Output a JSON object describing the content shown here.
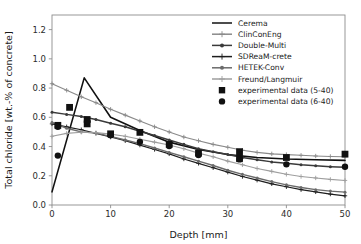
{
  "chart_data": {
    "type": "line",
    "title": "",
    "xlabel": "Depth [mm]",
    "ylabel": "Total chloride [wt.-% of concrete]",
    "xlim": [
      0,
      50
    ],
    "ylim": [
      0.0,
      1.3
    ],
    "xticks": [
      "0",
      "10",
      "20",
      "30",
      "40",
      "50"
    ],
    "xtick_values": [
      0,
      10,
      20,
      30,
      40,
      50
    ],
    "yticks": [
      "0.0",
      "0.2",
      "0.4",
      "0.6",
      "0.8",
      "1.0",
      "1.2"
    ],
    "ytick_values": [
      0.0,
      0.2,
      0.4,
      0.6,
      0.8,
      1.0,
      1.2
    ],
    "grid": false,
    "legend_position": "upper right",
    "series": [
      {
        "name": "Cerema",
        "color": "#111111",
        "marker": "none",
        "linewidth": 1.6,
        "x": [
          0,
          5.5,
          10,
          15,
          20,
          25,
          30,
          35,
          40,
          45,
          50
        ],
        "y": [
          0.09,
          0.87,
          0.6,
          0.51,
          0.43,
          0.38,
          0.345,
          0.325,
          0.315,
          0.31,
          0.305
        ]
      },
      {
        "name": "ClinConEng",
        "color": "#8a8a8a",
        "marker": "plus",
        "linewidth": 1.1,
        "x": [
          0,
          2.5,
          5,
          7.5,
          10,
          12.5,
          15,
          17.5,
          20,
          22.5,
          25,
          27.5,
          30,
          32.5,
          35,
          37.5,
          40,
          42.5,
          45,
          47.5,
          50
        ],
        "y": [
          0.83,
          0.785,
          0.74,
          0.7,
          0.655,
          0.615,
          0.575,
          0.535,
          0.5,
          0.465,
          0.44,
          0.415,
          0.395,
          0.375,
          0.36,
          0.35,
          0.345,
          0.34,
          0.335,
          0.332,
          0.33
        ]
      },
      {
        "name": "Double-Multi",
        "color": "#3a3a3a",
        "marker": "circle",
        "linewidth": 1.5,
        "x": [
          0,
          2.5,
          5,
          7.5,
          10,
          12.5,
          15,
          17.5,
          20,
          22.5,
          25,
          27.5,
          30,
          32.5,
          35,
          37.5,
          40,
          42.5,
          45,
          47.5,
          50
        ],
        "y": [
          0.635,
          0.62,
          0.605,
          0.585,
          0.56,
          0.535,
          0.505,
          0.475,
          0.445,
          0.415,
          0.385,
          0.365,
          0.345,
          0.325,
          0.31,
          0.295,
          0.285,
          0.275,
          0.268,
          0.262,
          0.258
        ]
      },
      {
        "name": "SDReaM-crete",
        "color": "#1d1d1d",
        "marker": "plus",
        "linewidth": 1.2,
        "x": [
          0,
          2.5,
          5,
          7.5,
          10,
          12.5,
          15,
          17.5,
          20,
          22.5,
          25,
          27.5,
          30,
          32.5,
          35,
          37.5,
          40,
          42.5,
          45,
          47.5,
          50
        ],
        "y": [
          0.555,
          0.535,
          0.515,
          0.49,
          0.465,
          0.44,
          0.41,
          0.38,
          0.35,
          0.315,
          0.285,
          0.255,
          0.225,
          0.195,
          0.17,
          0.145,
          0.125,
          0.105,
          0.09,
          0.075,
          0.063
        ]
      },
      {
        "name": "HETEK-Conv",
        "color": "#6b6b6b",
        "marker": "circle",
        "linewidth": 1.4,
        "x": [
          0,
          2.5,
          5,
          7.5,
          10,
          12.5,
          15,
          17.5,
          20,
          22.5,
          25,
          27.5,
          30,
          32.5,
          35,
          37.5,
          40,
          42.5,
          45,
          47.5,
          50
        ],
        "y": [
          0.565,
          0.525,
          0.5,
          0.492,
          0.47,
          0.445,
          0.42,
          0.39,
          0.36,
          0.33,
          0.3,
          0.27,
          0.238,
          0.21,
          0.185,
          0.16,
          0.138,
          0.12,
          0.105,
          0.095,
          0.088
        ]
      },
      {
        "name": "Freund/Langmuir",
        "color": "#9e9e9e",
        "marker": "plus",
        "linewidth": 1.1,
        "x": [
          0,
          2.5,
          5,
          7.5,
          10,
          12.5,
          15,
          17.5,
          20,
          22.5,
          25,
          27.5,
          30,
          32.5,
          35,
          37.5,
          40,
          42.5,
          45,
          47.5,
          50
        ],
        "y": [
          0.47,
          0.49,
          0.498,
          0.495,
          0.485,
          0.47,
          0.45,
          0.43,
          0.41,
          0.385,
          0.355,
          0.33,
          0.3,
          0.275,
          0.25,
          0.23,
          0.21,
          0.195,
          0.185,
          0.175,
          0.168
        ]
      }
    ],
    "scatter": [
      {
        "name": "experimental data (5-40)",
        "marker": "square",
        "color": "#111111",
        "points": [
          [
            1.0,
            0.545
          ],
          [
            3.0,
            0.668
          ],
          [
            6.0,
            0.585
          ],
          [
            6.0,
            0.555
          ],
          [
            10.0,
            0.487
          ],
          [
            15.0,
            0.497
          ],
          [
            20.0,
            0.415
          ],
          [
            25.0,
            0.355
          ],
          [
            32.0,
            0.365
          ],
          [
            32.0,
            0.318
          ],
          [
            40.0,
            0.325
          ],
          [
            50.0,
            0.348
          ]
        ]
      },
      {
        "name": "experimental data (6-40)",
        "marker": "circle",
        "color": "#111111",
        "points": [
          [
            1.0,
            0.338
          ],
          [
            1.0,
            0.535
          ],
          [
            6.0,
            0.575
          ],
          [
            10.0,
            0.478
          ],
          [
            15.0,
            0.432
          ],
          [
            20.0,
            0.403
          ],
          [
            25.0,
            0.342
          ],
          [
            32.0,
            0.312
          ],
          [
            40.0,
            0.278
          ],
          [
            50.0,
            0.262
          ]
        ]
      }
    ]
  },
  "legend": {
    "entries": [
      {
        "label": "Cerema",
        "type": "line",
        "marker": "none",
        "color": "#111111"
      },
      {
        "label": "ClinConEng",
        "type": "line",
        "marker": "plus",
        "color": "#8a8a8a"
      },
      {
        "label": "Double-Multi",
        "type": "line",
        "marker": "circle",
        "color": "#3a3a3a"
      },
      {
        "label": "SDReaM-crete",
        "type": "line",
        "marker": "plus",
        "color": "#1d1d1d"
      },
      {
        "label": "HETEK-Conv",
        "type": "line",
        "marker": "circle",
        "color": "#6b6b6b"
      },
      {
        "label": "Freund/Langmuir",
        "type": "line",
        "marker": "plus",
        "color": "#9e9e9e"
      },
      {
        "label": "experimental data (5-40)",
        "type": "marker",
        "marker": "square",
        "color": "#111111"
      },
      {
        "label": "experimental data (6-40)",
        "type": "marker",
        "marker": "circle",
        "color": "#111111"
      }
    ]
  },
  "colors": {
    "background": "#ffffff",
    "axis": "#8d8d8d",
    "text": "#1a1a1a"
  }
}
